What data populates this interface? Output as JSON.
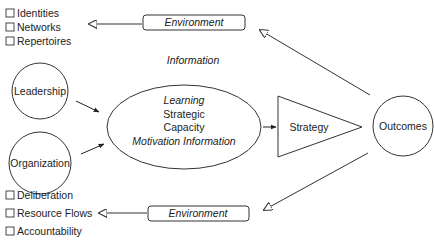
{
  "diagram": {
    "top_list": {
      "items": [
        "Identities",
        "Networks",
        "Repertoires"
      ]
    },
    "bottom_list": {
      "items": [
        "Deliberation",
        "Resource Flows",
        "Accountability"
      ]
    },
    "top_environment": "Environment",
    "bottom_environment": "Environment",
    "information_label": "Information",
    "nodes": {
      "leadership": "Leadership",
      "organization": "Organization",
      "strategy": "Strategy",
      "outcomes": "Outcomes"
    },
    "center_ellipse": {
      "lines": [
        "Learning",
        "Strategic",
        "Capacity",
        "Motivation Information"
      ]
    },
    "checkbox_glyph": "☐",
    "colors": {
      "stroke": "#333333",
      "text": "#222222",
      "background": "#ffffff"
    }
  }
}
